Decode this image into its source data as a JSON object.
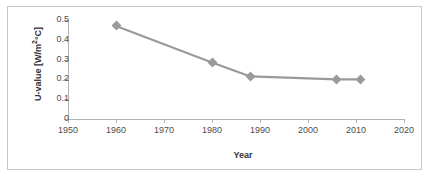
{
  "chart_data": {
    "type": "line",
    "title": "",
    "xlabel": "Year",
    "ylabel": "U-value [W/m²°C]",
    "xlim": [
      1950,
      2020
    ],
    "ylim": [
      0,
      0.5
    ],
    "grid": false,
    "legend": "none",
    "x_ticks": [
      "1950",
      "1960",
      "1970",
      "1980",
      "1990",
      "2000",
      "2010",
      "2020"
    ],
    "x_tick_values": [
      1950,
      1960,
      1970,
      1980,
      1990,
      2000,
      2010,
      2020
    ],
    "y_ticks": [
      "0.5",
      "0.4",
      "0.3",
      "0.2",
      "0.1",
      "0"
    ],
    "y_tick_values": [
      0.5,
      0.4,
      0.3,
      0.2,
      0.1,
      0
    ],
    "x": [
      1960,
      1980,
      1988,
      2006,
      2011
    ],
    "values": [
      0.47,
      0.285,
      0.215,
      0.2,
      0.2
    ],
    "series": [
      {
        "name": "U-value",
        "color": "#9a9a9a",
        "marker": "diamond",
        "points": [
          {
            "x": 1960,
            "y": 0.47
          },
          {
            "x": 1980,
            "y": 0.285
          },
          {
            "x": 1988,
            "y": 0.215
          },
          {
            "x": 2006,
            "y": 0.2
          },
          {
            "x": 2011,
            "y": 0.2
          }
        ]
      }
    ]
  },
  "axes": {
    "y_title": "U-value [W/m",
    "y_title_sup": "2",
    "y_title_tail": "°C]",
    "x_title": "Year"
  },
  "colors": {
    "series": "#9a9a9a",
    "axis": "#b3b3b3",
    "tick_text": "#4d4d4d",
    "title_text": "#333333",
    "frame_border": "#c8c8c8",
    "background": "#ffffff"
  }
}
